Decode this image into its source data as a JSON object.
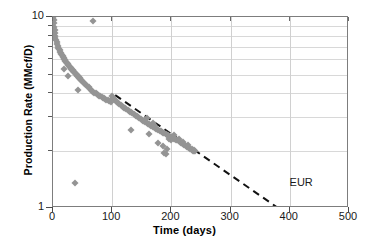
{
  "chart_data": {
    "type": "scatter",
    "title": "",
    "xlabel": "Time (days)",
    "ylabel": "Production Rate (MMcf/D)",
    "xlim": [
      0,
      500
    ],
    "ylim": [
      1,
      10
    ],
    "yscale": "log",
    "xscale": "linear",
    "grid": true,
    "legend": "none",
    "xticks": [
      0,
      100,
      200,
      300,
      400,
      500
    ],
    "xticklabels": [
      "0",
      "100",
      "200",
      "300",
      "400",
      "500"
    ],
    "yticks": [
      1,
      10
    ],
    "yticklabels": [
      "1",
      "10"
    ],
    "yminorticks": [
      2,
      3,
      4,
      5,
      6,
      7,
      8,
      9
    ],
    "annotations": [
      {
        "text": "EUR",
        "x": 430,
        "y": 1.35
      }
    ],
    "series": [
      {
        "name": "Production data",
        "type": "scatter",
        "marker": "diamond",
        "color": "#949494",
        "points": [
          [
            0.5,
            9.9
          ],
          [
            1,
            9.6
          ],
          [
            1.5,
            9.3
          ],
          [
            2,
            8.9
          ],
          [
            2.5,
            8.6
          ],
          [
            3,
            8.3
          ],
          [
            3.5,
            8.0
          ],
          [
            4,
            7.8
          ],
          [
            5,
            7.6
          ],
          [
            6,
            7.4
          ],
          [
            7,
            7.2
          ],
          [
            8,
            7.05
          ],
          [
            9,
            6.9
          ],
          [
            10,
            6.8
          ],
          [
            11,
            6.7
          ],
          [
            12,
            6.6
          ],
          [
            13,
            6.5
          ],
          [
            14,
            6.42
          ],
          [
            15,
            6.35
          ],
          [
            16,
            6.28
          ],
          [
            17,
            6.2
          ],
          [
            18,
            6.12
          ],
          [
            19,
            6.05
          ],
          [
            20,
            5.98
          ],
          [
            21,
            5.9
          ],
          [
            22,
            5.84
          ],
          [
            23,
            5.78
          ],
          [
            24,
            5.72
          ],
          [
            25,
            5.66
          ],
          [
            26,
            5.6
          ],
          [
            27,
            5.55
          ],
          [
            28,
            5.5
          ],
          [
            29,
            5.45
          ],
          [
            30,
            5.4
          ],
          [
            31,
            5.35
          ],
          [
            32,
            5.3
          ],
          [
            33,
            5.26
          ],
          [
            34,
            5.22
          ],
          [
            35,
            5.18
          ],
          [
            36,
            5.14
          ],
          [
            37,
            5.1
          ],
          [
            38,
            5.06
          ],
          [
            39,
            5.02
          ],
          [
            40,
            4.98
          ],
          [
            41,
            4.94
          ],
          [
            42,
            4.9
          ],
          [
            43,
            4.86
          ],
          [
            44,
            4.82
          ],
          [
            45,
            4.78
          ],
          [
            46,
            4.74
          ],
          [
            47,
            4.7
          ],
          [
            48,
            4.66
          ],
          [
            49,
            4.62
          ],
          [
            50,
            4.58
          ],
          [
            52,
            4.52
          ],
          [
            54,
            4.45
          ],
          [
            56,
            4.4
          ],
          [
            58,
            4.34
          ],
          [
            60,
            4.28
          ],
          [
            62,
            4.22
          ],
          [
            64,
            4.17
          ],
          [
            66,
            4.12
          ],
          [
            68,
            4.07
          ],
          [
            70,
            4.02
          ],
          [
            72,
            3.98
          ],
          [
            74,
            3.94
          ],
          [
            76,
            3.9
          ],
          [
            78,
            3.87
          ],
          [
            80,
            3.84
          ],
          [
            82,
            3.81
          ],
          [
            84,
            3.78
          ],
          [
            86,
            3.75
          ],
          [
            88,
            3.72
          ],
          [
            90,
            3.7
          ],
          [
            92,
            3.67
          ],
          [
            94,
            3.64
          ],
          [
            96,
            3.62
          ],
          [
            98,
            3.6
          ],
          [
            100,
            3.85
          ],
          [
            101,
            3.78
          ],
          [
            102,
            3.72
          ],
          [
            104,
            3.66
          ],
          [
            106,
            3.62
          ],
          [
            108,
            3.58
          ],
          [
            110,
            3.54
          ],
          [
            112,
            3.5
          ],
          [
            114,
            3.46
          ],
          [
            116,
            3.43
          ],
          [
            118,
            3.4
          ],
          [
            120,
            3.36
          ],
          [
            122,
            3.33
          ],
          [
            124,
            3.3
          ],
          [
            126,
            3.27
          ],
          [
            128,
            3.24
          ],
          [
            130,
            3.2
          ],
          [
            132,
            3.17
          ],
          [
            134,
            3.14
          ],
          [
            136,
            3.11
          ],
          [
            138,
            3.08
          ],
          [
            140,
            3.05
          ],
          [
            142,
            3.02
          ],
          [
            144,
            2.99
          ],
          [
            146,
            2.96
          ],
          [
            148,
            2.93
          ],
          [
            150,
            2.9
          ],
          [
            152,
            2.87
          ],
          [
            154,
            2.85
          ],
          [
            156,
            2.82
          ],
          [
            158,
            2.79
          ],
          [
            160,
            2.77
          ],
          [
            162,
            2.74
          ],
          [
            164,
            2.72
          ],
          [
            166,
            2.7
          ],
          [
            168,
            2.67
          ],
          [
            170,
            2.65
          ],
          [
            172,
            2.62
          ],
          [
            174,
            2.6
          ],
          [
            176,
            2.58
          ],
          [
            178,
            2.56
          ],
          [
            180,
            2.54
          ],
          [
            182,
            2.52
          ],
          [
            184,
            2.5
          ],
          [
            186,
            2.48
          ],
          [
            188,
            2.46
          ],
          [
            190,
            2.44
          ],
          [
            192,
            2.42
          ],
          [
            194,
            2.4
          ],
          [
            196,
            2.38
          ],
          [
            198,
            2.36
          ],
          [
            200,
            2.35
          ],
          [
            202,
            2.33
          ],
          [
            204,
            2.31
          ],
          [
            206,
            2.3
          ],
          [
            208,
            2.28
          ],
          [
            210,
            2.26
          ],
          [
            212,
            2.24
          ],
          [
            214,
            2.22
          ],
          [
            216,
            2.2
          ],
          [
            218,
            2.18
          ],
          [
            220,
            2.16
          ],
          [
            222,
            2.14
          ],
          [
            224,
            2.12
          ],
          [
            226,
            2.1
          ],
          [
            228,
            2.08
          ],
          [
            230,
            2.06
          ],
          [
            232,
            2.04
          ],
          [
            234,
            2.02
          ],
          [
            236,
            2.0
          ],
          [
            238,
            1.99
          ],
          [
            240,
            1.98
          ],
          [
            18,
            5.35
          ],
          [
            26,
            4.9
          ],
          [
            42,
            4.15
          ],
          [
            67,
            9.5
          ],
          [
            37,
            1.35
          ],
          [
            132,
            2.55
          ],
          [
            162,
            2.45
          ],
          [
            178,
            2.2
          ],
          [
            186,
            2.12
          ],
          [
            188,
            1.95
          ],
          [
            191,
            1.92
          ],
          [
            193,
            2.05
          ],
          [
            155,
            2.88
          ],
          [
            158,
            2.95
          ],
          [
            168,
            2.78
          ],
          [
            171,
            2.72
          ],
          [
            196,
            2.3
          ],
          [
            199,
            2.26
          ],
          [
            205,
            2.4
          ],
          [
            212,
            2.3
          ],
          [
            220,
            2.22
          ],
          [
            228,
            2.14
          ],
          [
            235,
            2.05
          ],
          [
            238,
            2.02
          ]
        ]
      }
    ],
    "trendline": {
      "name": "Exponential decline fit",
      "style": "dashed",
      "color": "#111111",
      "x_start": 105,
      "y_start": 3.9,
      "x_end": 380,
      "y_end": 1.0
    }
  }
}
